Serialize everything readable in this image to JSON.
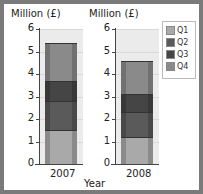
{
  "chart_data": {
    "type": "bar",
    "stacked": true,
    "categories": [
      "2007",
      "2008"
    ],
    "series": [
      {
        "name": "Q1",
        "values": [
          1.5,
          1.2
        ],
        "color": "#a9a9a9"
      },
      {
        "name": "Q2",
        "values": [
          1.3,
          1.1
        ],
        "color": "#5a5a5a"
      },
      {
        "name": "Q3",
        "values": [
          0.9,
          0.8
        ],
        "color": "#454545"
      },
      {
        "name": "Q4",
        "values": [
          1.7,
          1.5
        ],
        "color": "#8a8a8a"
      }
    ],
    "totals": [
      5.4,
      4.6
    ],
    "ylabel": "Million (£)",
    "xlabel": "Year",
    "yticks": [
      "0",
      "1",
      "2",
      "3",
      "4",
      "5",
      "6"
    ],
    "ylim": [
      0,
      6
    ],
    "legend_position": "right",
    "grid": true
  },
  "labels": {
    "ylabel_left": "Million (£)",
    "ylabel_right": "Million (£)",
    "xlabel": "Year",
    "cat1": "2007",
    "cat2": "2008",
    "legend": [
      "Q1",
      "Q2",
      "Q3",
      "Q4"
    ],
    "ticks": [
      "0",
      "1",
      "2",
      "3",
      "4",
      "5",
      "6"
    ]
  }
}
